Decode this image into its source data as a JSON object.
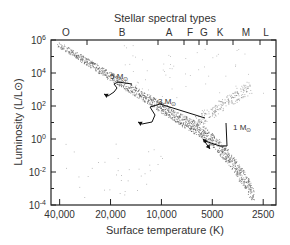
{
  "chart_data": {
    "type": "scatter",
    "title": "Stellar spectral types",
    "xlabel": "Surface temperature (K)",
    "ylabel": "Luminosity (L/L⊙)",
    "x_scale": "log-reversed",
    "y_scale": "log",
    "xlim": [
      45000,
      2100
    ],
    "ylim": [
      0.0001,
      1000000
    ],
    "x_ticks": [
      {
        "value": 40000,
        "label": "40,000"
      },
      {
        "value": 20000,
        "label": "20,000"
      },
      {
        "value": 10000,
        "label": "10,000"
      },
      {
        "value": 5000,
        "label": "5000"
      },
      {
        "value": 2500,
        "label": "2500"
      }
    ],
    "y_ticks": [
      {
        "exp": 6,
        "label": "10",
        "sup": "6"
      },
      {
        "exp": 4,
        "label": "10",
        "sup": "4"
      },
      {
        "exp": 2,
        "label": "10",
        "sup": "2"
      },
      {
        "exp": 0,
        "label": "10",
        "sup": "0"
      },
      {
        "exp": -2,
        "label": "10",
        "sup": "-2"
      },
      {
        "exp": -4,
        "label": "10",
        "sup": "-4"
      }
    ],
    "spectral_types": [
      {
        "label": "O",
        "temperature": 33000
      },
      {
        "label": "B",
        "temperature": 18000
      },
      {
        "label": "A",
        "temperature": 8500
      },
      {
        "label": "F",
        "temperature": 6500
      },
      {
        "label": "G",
        "temperature": 5700
      },
      {
        "label": "K",
        "temperature": 4300
      },
      {
        "label": "M",
        "temperature": 3100
      },
      {
        "label": "L",
        "temperature": 2200
      }
    ],
    "evolutionary_tracks": [
      {
        "name": "5 M⊙",
        "mass": 5,
        "label_pos": [
          110,
          79
        ],
        "path_px": [
          [
            132,
            84
          ],
          [
            118,
            82
          ],
          [
            114,
            84
          ],
          [
            117,
            88
          ],
          [
            114,
            92
          ],
          [
            108,
            96
          ],
          [
            104,
            94
          ]
        ]
      },
      {
        "name": "3 M⊙",
        "mass": 3,
        "label_pos": [
          158,
          104
        ],
        "path_px": [
          [
            205,
            118
          ],
          [
            160,
            104
          ],
          [
            150,
            107
          ],
          [
            155,
            115
          ],
          [
            152,
            122
          ],
          [
            142,
            124
          ],
          [
            138,
            122
          ]
        ]
      },
      {
        "name": "1 M⊙",
        "mass": 1,
        "label_pos": [
          233,
          130
        ],
        "path_px": [
          [
            226,
            123
          ],
          [
            227,
            146
          ],
          [
            220,
            146
          ],
          [
            205,
            141
          ],
          [
            203,
            139
          ],
          [
            210,
            149
          ]
        ]
      }
    ],
    "regions": [
      {
        "name": "main sequence",
        "from_px": [
          58,
          44
        ],
        "to_px": [
          258,
          202
        ]
      },
      {
        "name": "giant branch",
        "from_px": [
          200,
          120
        ],
        "to_px": [
          250,
          80
        ]
      },
      {
        "name": "white dwarfs",
        "center_px": [
          130,
          175
        ]
      }
    ],
    "grid": false,
    "legend": "none"
  }
}
